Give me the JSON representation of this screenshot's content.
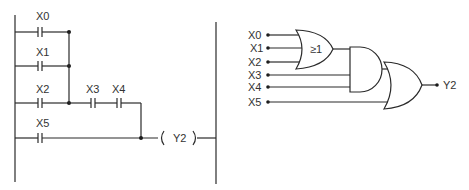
{
  "ladder": {
    "contacts": [
      {
        "label": "X0",
        "type": "normally-open"
      },
      {
        "label": "X1",
        "type": "normally-open"
      },
      {
        "label": "X2",
        "type": "normally-open"
      },
      {
        "label": "X3",
        "type": "normally-open"
      },
      {
        "label": "X4",
        "type": "normally-open"
      },
      {
        "label": "X5",
        "type": "normally-open"
      }
    ],
    "coil": {
      "label": "Y2"
    }
  },
  "logic": {
    "inputs": [
      "X0",
      "X1",
      "X2",
      "X3",
      "X4",
      "X5"
    ],
    "or_gate_symbol": "≥1",
    "output": "Y2"
  }
}
